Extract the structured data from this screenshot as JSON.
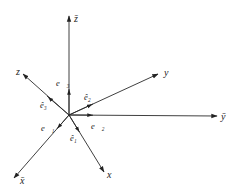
{
  "diagram": {
    "type": "coordinate-frames",
    "origin": [
      69,
      115
    ],
    "fixed_frame": {
      "axes": [
        {
          "name": "x-bar-axis",
          "label": "x̄",
          "end": [
            14,
            178
          ],
          "label_pos": [
            20,
            183
          ]
        },
        {
          "name": "y-bar-axis",
          "label": "ȳ",
          "end": [
            217,
            116
          ],
          "label_pos": [
            221,
            120
          ]
        },
        {
          "name": "z-bar-axis",
          "label": "z̄",
          "end": [
            69,
            16
          ],
          "label_pos": [
            74,
            21
          ]
        }
      ],
      "unit_vectors": [
        {
          "name": "e1-vector",
          "label": "e⃗₁",
          "arrow_at": [
            57,
            132
          ],
          "label_pos": [
            40,
            130
          ]
        },
        {
          "name": "e2-vector",
          "label": "e⃗₂",
          "arrow_at": [
            93,
            116
          ],
          "label_pos": [
            92,
            128
          ]
        },
        {
          "name": "e3-vector",
          "label": "e⃗₃",
          "arrow_at": [
            69,
            89
          ],
          "label_pos": [
            56,
            85
          ]
        }
      ]
    },
    "rotated_frame": {
      "axes": [
        {
          "name": "x-axis",
          "label": "x",
          "end": [
            104,
            172
          ],
          "label_pos": [
            108,
            177
          ]
        },
        {
          "name": "y-axis",
          "label": "y",
          "end": [
            158,
            74
          ],
          "label_pos": [
            164,
            75
          ]
        },
        {
          "name": "z-axis",
          "label": "z",
          "end": [
            23,
            74
          ],
          "label_pos": [
            17,
            74
          ]
        }
      ],
      "unit_vectors": [
        {
          "name": "e1-hat-vector",
          "label": "ê₁",
          "arrow_at": [
            80,
            132
          ],
          "label_pos": [
            70,
            140
          ]
        },
        {
          "name": "e2-hat-vector",
          "label": "ê₂",
          "arrow_at": [
            93,
            104
          ],
          "label_pos": [
            84,
            100
          ]
        },
        {
          "name": "e3-hat-vector",
          "label": "ê₃",
          "arrow_at": [
            46,
            95
          ],
          "label_pos": [
            40,
            108
          ]
        }
      ]
    }
  }
}
